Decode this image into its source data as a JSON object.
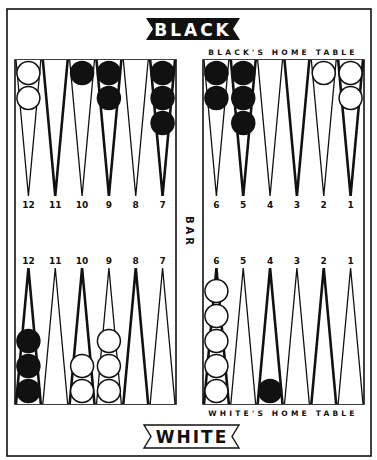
{
  "banners": {
    "top": "BLACK",
    "bottom": "WHITE"
  },
  "labels": {
    "black_home": "BLACK'S HOME TABLE",
    "white_home": "WHITE'S HOME TABLE",
    "bar": "BAR"
  },
  "colors": {
    "ink": "#111111",
    "paper": "#ffffff"
  },
  "quadrants": [
    {
      "id": "top-left",
      "side": "left",
      "row": "top",
      "points": [
        {
          "label": "12",
          "style": "thin",
          "checkers": {
            "color": "white",
            "count": 2
          }
        },
        {
          "label": "11",
          "style": "thick",
          "checkers": {
            "color": null,
            "count": 0
          }
        },
        {
          "label": "10",
          "style": "thin",
          "checkers": {
            "color": "black",
            "count": 1
          }
        },
        {
          "label": "9",
          "style": "thick",
          "checkers": {
            "color": "black",
            "count": 2
          }
        },
        {
          "label": "8",
          "style": "thin",
          "checkers": {
            "color": null,
            "count": 0
          }
        },
        {
          "label": "7",
          "style": "thick",
          "checkers": {
            "color": "black",
            "count": 3
          }
        }
      ]
    },
    {
      "id": "top-right",
      "side": "right",
      "row": "top",
      "points": [
        {
          "label": "6",
          "style": "thin",
          "checkers": {
            "color": "black",
            "count": 2
          }
        },
        {
          "label": "5",
          "style": "thick",
          "checkers": {
            "color": "black",
            "count": 3
          }
        },
        {
          "label": "4",
          "style": "thin",
          "checkers": {
            "color": null,
            "count": 0
          }
        },
        {
          "label": "3",
          "style": "thick",
          "checkers": {
            "color": null,
            "count": 0
          }
        },
        {
          "label": "2",
          "style": "thin",
          "checkers": {
            "color": "white",
            "count": 1
          }
        },
        {
          "label": "1",
          "style": "thick",
          "checkers": {
            "color": "white",
            "count": 2
          }
        }
      ]
    },
    {
      "id": "bottom-left",
      "side": "left",
      "row": "bottom",
      "points": [
        {
          "label": "12",
          "style": "thick",
          "checkers": {
            "color": "black",
            "count": 3
          }
        },
        {
          "label": "11",
          "style": "thin",
          "checkers": {
            "color": null,
            "count": 0
          }
        },
        {
          "label": "10",
          "style": "thick",
          "checkers": {
            "color": "white",
            "count": 2
          }
        },
        {
          "label": "9",
          "style": "thin",
          "checkers": {
            "color": "white",
            "count": 3
          }
        },
        {
          "label": "8",
          "style": "thick",
          "checkers": {
            "color": null,
            "count": 0
          }
        },
        {
          "label": "7",
          "style": "thin",
          "checkers": {
            "color": null,
            "count": 0
          }
        }
      ]
    },
    {
      "id": "bottom-right",
      "side": "right",
      "row": "bottom",
      "points": [
        {
          "label": "6",
          "style": "thick",
          "checkers": {
            "color": "white",
            "count": 5
          }
        },
        {
          "label": "5",
          "style": "thin",
          "checkers": {
            "color": null,
            "count": 0
          }
        },
        {
          "label": "4",
          "style": "thick",
          "checkers": {
            "color": "black",
            "count": 1
          }
        },
        {
          "label": "3",
          "style": "thin",
          "checkers": {
            "color": null,
            "count": 0
          }
        },
        {
          "label": "2",
          "style": "thick",
          "checkers": {
            "color": null,
            "count": 0
          }
        },
        {
          "label": "1",
          "style": "thin",
          "checkers": {
            "color": null,
            "count": 0
          }
        }
      ]
    }
  ]
}
